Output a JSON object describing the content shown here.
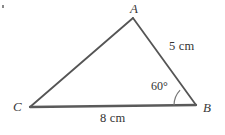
{
  "figure": {
    "type": "geometry-triangle-diagram",
    "background_color": "#ffffff",
    "stroke_color": "#555555",
    "text_color": "#333333",
    "vertices": [
      {
        "name": "A",
        "label": "A",
        "x": 133,
        "y": 18
      },
      {
        "name": "B",
        "label": "B",
        "x": 196,
        "y": 105
      },
      {
        "name": "C",
        "label": "C",
        "x": 30,
        "y": 107
      }
    ],
    "sides": [
      {
        "name": "side-ab",
        "from": "A",
        "to": "B",
        "label": "5 cm",
        "value": 5,
        "unit": "cm"
      },
      {
        "name": "side-cb",
        "from": "C",
        "to": "B",
        "label": "8 cm",
        "value": 8,
        "unit": "cm"
      },
      {
        "name": "side-ca",
        "from": "C",
        "to": "A",
        "label": "",
        "value": null,
        "unit": ""
      }
    ],
    "angles": [
      {
        "name": "angle-b",
        "at": "B",
        "label": "60°",
        "value": 60,
        "unit": "degrees",
        "arc_radius": 22
      }
    ],
    "marks": [
      {
        "name": "corner-mark",
        "label": "",
        "x": 2,
        "y": 5
      }
    ]
  }
}
